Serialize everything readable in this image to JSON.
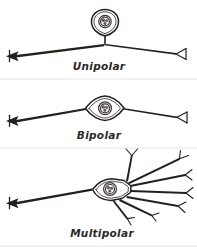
{
  "figure": {
    "background_color": "#ffffff",
    "ink_color": "#24201e",
    "divider_color": "#e6e4e2",
    "width": 197,
    "height": 249
  },
  "panels": [
    {
      "id": "unipolar",
      "label": "Unipolar",
      "label_x": 99,
      "label_y": 70,
      "soma_shape": "teardrop",
      "description": "Single process leaving a rounded pear-shaped cell body that splits into two opposite branches"
    },
    {
      "id": "bipolar",
      "label": "Bipolar",
      "label_x": 99,
      "label_y": 139,
      "soma_shape": "lens",
      "description": "Spindle-shaped cell body with one process at each pole"
    },
    {
      "id": "multipolar",
      "label": "Multipolar",
      "label_x": 102,
      "label_y": 237,
      "soma_shape": "angular",
      "description": "Angular cell body with a single long axon to the left and many branching dendrites to the right"
    }
  ],
  "nucleus": {
    "label": "nucleus",
    "fill": "#ffffff",
    "nucleolus_fill": "#6a625e"
  },
  "terminals": {
    "arrowhead": "solid-left-arrowhead",
    "fork": "y-shaped-branch-tip"
  }
}
